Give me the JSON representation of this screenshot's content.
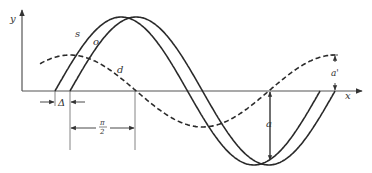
{
  "diagram": {
    "axes": {
      "x_label": "x",
      "y_label": "y"
    },
    "curves": [
      {
        "id": "s",
        "label": "s",
        "style": "solid",
        "description": "sine curve, leading"
      },
      {
        "id": "o",
        "label": "o",
        "style": "solid",
        "description": "sine curve, lagging by delta"
      },
      {
        "id": "d",
        "label": "d",
        "style": "dashed",
        "description": "quadrature curve, shifted pi/2, smaller amplitude"
      }
    ],
    "annotations": {
      "delta": "Δ",
      "half_pi_num": "π",
      "half_pi_den": "2",
      "amplitude": "a",
      "amplitude_prime": "a'"
    },
    "colors": {
      "stroke": "#2a2a2a",
      "axis": "#555555"
    }
  }
}
